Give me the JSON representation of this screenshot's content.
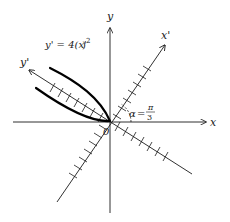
{
  "diagram": {
    "type": "rotated-axes-parabola",
    "axes": {
      "x_label": "x",
      "y_label": "y",
      "xprime_label": "x'",
      "yprime_label": "y'",
      "origin_label": "0"
    },
    "equation": {
      "lhs": "y' = 4(x'",
      "rhs_close": ")",
      "exponent": "2"
    },
    "angle": {
      "symbol": "α",
      "equals": "=",
      "numerator": "π",
      "denominator": "3"
    },
    "colors": {
      "ink": "#1a1a1a",
      "curve": "#000000",
      "background": "#ffffff"
    }
  }
}
